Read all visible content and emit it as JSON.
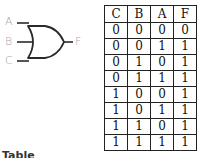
{
  "diagram": {
    "gate_type": "OR",
    "inputs": [
      {
        "label": "A"
      },
      {
        "label": "B"
      },
      {
        "label": "C"
      }
    ],
    "output": {
      "label": "F"
    },
    "line_color": "#2a2a2a",
    "label_color": "#a8a8a8"
  },
  "truth_table": {
    "headers": [
      "C",
      "B",
      "A",
      "F"
    ],
    "rows": [
      [
        "0",
        "0",
        "0",
        "0"
      ],
      [
        "0",
        "0",
        "1",
        "1"
      ],
      [
        "0",
        "1",
        "0",
        "1"
      ],
      [
        "0",
        "1",
        "1",
        "1"
      ],
      [
        "1",
        "0",
        "0",
        "1"
      ],
      [
        "1",
        "0",
        "1",
        "1"
      ],
      [
        "1",
        "1",
        "0",
        "1"
      ],
      [
        "1",
        "1",
        "1",
        "1"
      ]
    ]
  },
  "caption": {
    "text": "Table"
  }
}
